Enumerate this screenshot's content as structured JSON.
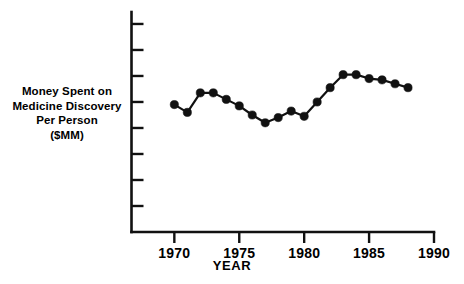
{
  "chart_data": {
    "type": "line",
    "title": "",
    "subtitle": "",
    "xlabel": "YEAR",
    "ylabel": "Money Spent on Medicine Discovery Per Person ($MM)",
    "ylabel_lines": [
      "Money Spent on",
      "Medicine Discovery",
      "Per Person",
      "($MM)"
    ],
    "x": [
      1970,
      1971,
      1972,
      1973,
      1974,
      1975,
      1976,
      1977,
      1978,
      1979,
      1980,
      1981,
      1982,
      1983,
      1984,
      1985,
      1986,
      1987,
      1988
    ],
    "values": [
      4.9,
      4.6,
      5.35,
      5.35,
      5.1,
      4.85,
      4.5,
      4.2,
      4.4,
      4.65,
      4.45,
      5.0,
      5.55,
      6.05,
      6.05,
      5.9,
      5.85,
      5.7,
      5.55
    ],
    "series": [
      {
        "name": "Money Spent on Medicine Discovery Per Person",
        "values": [
          4.9,
          4.6,
          5.35,
          5.35,
          5.1,
          4.85,
          4.5,
          4.2,
          4.4,
          4.65,
          4.45,
          5.0,
          5.55,
          6.05,
          6.05,
          5.9,
          5.85,
          5.7,
          5.55
        ]
      }
    ],
    "xlim": [
      1966.7,
      1990
    ],
    "ylim": [
      0,
      8.46
    ],
    "xticks": [
      1970,
      1975,
      1980,
      1985,
      1990
    ],
    "xtick_labels": [
      "1970",
      "1975",
      "1980",
      "1985",
      "1990"
    ],
    "yticks": [
      1,
      2,
      3,
      4,
      5,
      6,
      7,
      8
    ],
    "ytick_labels": [
      "",
      "",
      "",
      "",
      "",
      "",
      "",
      ""
    ],
    "grid": false,
    "legend": false,
    "legend_position": "none",
    "marker": "filled-circle",
    "line_color": "#111111",
    "marker_color": "#111111",
    "axis_color": "#111111",
    "background_color": "#ffffff"
  }
}
